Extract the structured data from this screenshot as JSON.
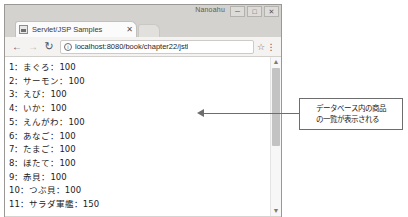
{
  "window": {
    "title": "Nanoahu",
    "buttons": [
      {
        "name": "minimize",
        "glyph": "─"
      },
      {
        "name": "maximize",
        "glyph": "□"
      },
      {
        "name": "close",
        "glyph": "✕"
      }
    ]
  },
  "tab": {
    "title": "Servlet/JSP Samples",
    "close_glyph": "✕",
    "favicon": "page-favicon"
  },
  "toolbar": {
    "back_glyph": "←",
    "forward_glyph": "→",
    "reload_glyph": "↻",
    "info_glyph": "ⓘ",
    "url": "localhost:8080/book/chapter22/jstl",
    "url_placeholder": "Search or type URL",
    "star_glyph": "☆",
    "menu_glyph": "⋮"
  },
  "page": {
    "items": [
      "1：まぐろ：100",
      "2：サーモン：100",
      "3：えび：100",
      "4：いか：100",
      "5：えんがわ：100",
      "6：あなご：100",
      "7：たまご：100",
      "8：ほたて：100",
      "9：赤貝：100",
      "10：つぶ貝：100",
      "11：サラダ軍艦：150"
    ]
  },
  "scrollbar": {
    "up_glyph": "▲",
    "down_glyph": "▼"
  },
  "annotation": {
    "line1": "データベース内の商品",
    "line2": "の一覧が表示される"
  },
  "colors": {
    "chrome_frame": "#d4d2ce",
    "toolbar": "#f4f3f1",
    "page_bg": "#ffffff",
    "callout_border": "#6d6d6d",
    "text": "#1b1b1b"
  }
}
